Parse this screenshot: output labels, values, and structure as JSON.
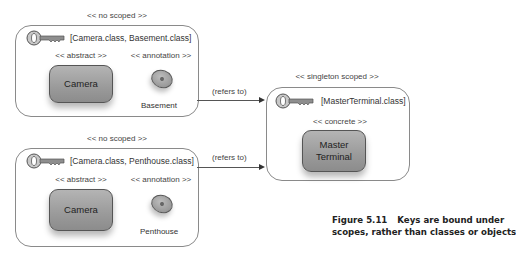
{
  "diagram": {
    "scopes": [
      {
        "stereotype": "<< no scoped >>",
        "key_text": "[Camera.class, Basement.class]",
        "class_stereotype": "<< abstract >>",
        "class_name": "Camera",
        "annotation_stereotype": "<< annotation >>",
        "annotation_name": "Basement"
      },
      {
        "stereotype": "<< no scoped >>",
        "key_text": "[Camera.class, Penthouse.class]",
        "class_stereotype": "<< abstract >>",
        "class_name": "Camera",
        "annotation_stereotype": "<< annotation >>",
        "annotation_name": "Penthouse"
      },
      {
        "stereotype": "<< singleton scoped >>",
        "key_text": "[MasterTerminal.class]",
        "class_stereotype": "<< concrete >>",
        "class_name_line1": "Master",
        "class_name_line2": "Terminal"
      }
    ],
    "arrows": [
      {
        "label": "(refers to)"
      },
      {
        "label": "(refers to)"
      }
    ],
    "icons": {
      "key": "key-icon",
      "annotation": "annotation-ellipse-icon",
      "arrow": "arrow-right-icon"
    },
    "colors": {
      "box_border": "#8a8a8a",
      "class_fill": "#9a9a9a",
      "text": "#333333"
    }
  },
  "caption": {
    "number": "Figure 5.11",
    "line1": "Keys are bound under",
    "line2": "scopes, rather than classes or objects"
  }
}
